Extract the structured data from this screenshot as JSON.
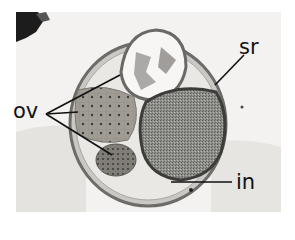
{
  "figure": {
    "labels": {
      "ov": "ov",
      "sr": "sr",
      "in": "in"
    }
  }
}
